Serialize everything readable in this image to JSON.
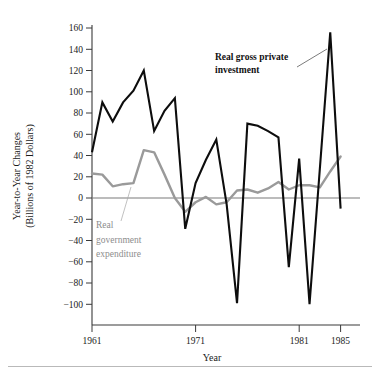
{
  "figure": {
    "y_axis_title_line1": "Year-to-Year Changes",
    "y_axis_title_line2": "(Billions of 1982 Dollars)",
    "x_axis_title": "Year",
    "annotation_investment_line1": "Real gross private",
    "annotation_investment_line2": "investment",
    "annotation_government_line1": "Real",
    "annotation_government_line2": "government",
    "annotation_government_line3": "expenditure",
    "colors": {
      "investment_series": "#0d0d0d",
      "government_series": "#9a9a9a",
      "axis": "#3a3a3a",
      "zero_line": "#7a7a7a",
      "background": "#ffffff"
    }
  },
  "chart_data": {
    "type": "line",
    "title": "",
    "xlabel": "Year",
    "ylabel": "Year-to-Year Changes (Billions of 1982 Dollars)",
    "xlim": [
      1960,
      1985.5
    ],
    "ylim": [
      -110,
      165
    ],
    "grid": false,
    "legend": "annotations-inline",
    "y_ticks": [
      -100,
      -80,
      -60,
      -40,
      -20,
      0,
      20,
      40,
      60,
      80,
      100,
      120,
      140,
      160
    ],
    "y_tick_labels": [
      "−100",
      "−80",
      "−60",
      "−40",
      "−20",
      "0",
      "20",
      "40",
      "60",
      "80",
      "100",
      "120",
      "140",
      "160"
    ],
    "x_ticks": [
      1961,
      1971,
      1981,
      1985
    ],
    "x_tick_labels": [
      "1961",
      "1971",
      "1981",
      "1985"
    ],
    "zero_reference_line": 0,
    "x": [
      1961,
      1962,
      1963,
      1964,
      1965,
      1966,
      1967,
      1968,
      1969,
      1970,
      1971,
      1972,
      1973,
      1974,
      1975,
      1976,
      1977,
      1978,
      1979,
      1980,
      1981,
      1982,
      1983,
      1984,
      1985
    ],
    "series": [
      {
        "name": "Real gross private investment",
        "color": "#0d0d0d",
        "values": [
          43,
          90,
          72,
          90,
          101,
          120,
          63,
          82,
          94,
          -29,
          14,
          36,
          55,
          -6,
          -99,
          70,
          68,
          63,
          57,
          -65,
          37,
          -100,
          28,
          156,
          -10
        ]
      },
      {
        "name": "Real government expenditure",
        "color": "#9a9a9a",
        "values": [
          23,
          22,
          11,
          13,
          14,
          45,
          43,
          22,
          0,
          -13,
          -4,
          1,
          -6,
          -4,
          7,
          8,
          5,
          9,
          15,
          8,
          12,
          12,
          10,
          25,
          39
        ]
      }
    ]
  }
}
